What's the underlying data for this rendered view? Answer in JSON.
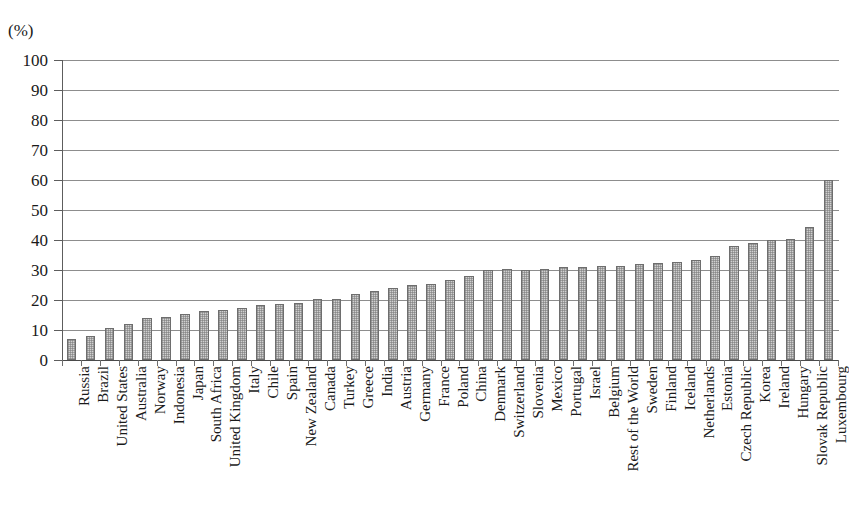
{
  "unit_label": "(%)",
  "chart_data": {
    "type": "bar",
    "title": "",
    "subtitle": "",
    "xlabel": "",
    "ylabel": "(%)",
    "ylim": [
      0,
      100
    ],
    "yticks": [
      0,
      10,
      20,
      30,
      40,
      50,
      60,
      70,
      80,
      90,
      100
    ],
    "grid": true,
    "legend": "none",
    "orientation": "vertical",
    "bar_fill_color": "#d0d0d0",
    "bar_border_color": "#6e6e6e",
    "axis_color": "#5d5d5d",
    "gridline_color": "#8d8d8d",
    "categories": [
      "Russia",
      "Brazil",
      "United States",
      "Australia",
      "Norway",
      "Indonesia",
      "Japan",
      "South Africa",
      "United Kingdom",
      "Italy",
      "Chile",
      "Spain",
      "New Zealand",
      "Canada",
      "Turkey",
      "Greece",
      "India",
      "Austria",
      "Germany",
      "France",
      "Poland",
      "China",
      "Denmark",
      "Switzerland",
      "Slovenia",
      "Mexico",
      "Portugal",
      "Israel",
      "Belgium",
      "Rest of the World",
      "Sweden",
      "Finland",
      "Iceland",
      "Netherlands",
      "Estonia",
      "Czech Republic",
      "Korea",
      "Ireland",
      "Hungary",
      "Slovak Republic",
      "Luxembourg"
    ],
    "values": [
      7,
      8,
      10.8,
      12,
      14,
      14.2,
      15.5,
      16.5,
      16.8,
      17.5,
      18.5,
      18.8,
      19,
      20.3,
      20.5,
      22,
      23,
      24,
      25,
      25.3,
      26.8,
      28,
      30,
      30.2,
      30,
      30.5,
      31,
      31,
      31.3,
      31.5,
      32,
      32.2,
      32.8,
      33.5,
      34.7,
      38,
      39,
      40,
      40.5,
      44.5,
      60
    ]
  }
}
